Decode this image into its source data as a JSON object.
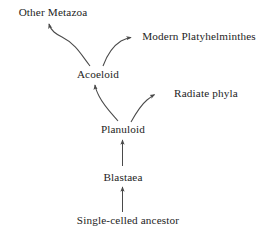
{
  "diagram": {
    "background_color": "#ffffff",
    "stroke_color": "#4a4a4a",
    "text_color": "#242424",
    "nodes": [
      {
        "id": "other_metazoa",
        "label": "Other Metazoa",
        "x": 53,
        "y": 13
      },
      {
        "id": "modern_platyhelminthes",
        "label": "Modern Platyhelminthes",
        "x": 199,
        "y": 37
      },
      {
        "id": "acoeloid",
        "label": "Acoeloid",
        "x": 98,
        "y": 75
      },
      {
        "id": "radiate_phyla",
        "label": "Radiate phyla",
        "x": 206,
        "y": 94
      },
      {
        "id": "planuloid",
        "label": "Planuloid",
        "x": 123,
        "y": 130
      },
      {
        "id": "blastaea",
        "label": "Blastaea",
        "x": 123,
        "y": 178
      },
      {
        "id": "single_celled_ancestor",
        "label": "Single-celled ancestor",
        "x": 128,
        "y": 221
      }
    ],
    "edges": [
      {
        "id": "acoeloid-to-other-metazoa",
        "from": "acoeloid",
        "to": "other_metazoa",
        "style": "curved"
      },
      {
        "id": "acoeloid-to-modern-platyhelminthes",
        "from": "acoeloid",
        "to": "modern_platyhelminthes",
        "style": "curved"
      },
      {
        "id": "planuloid-to-acoeloid",
        "from": "planuloid",
        "to": "acoeloid",
        "style": "curved"
      },
      {
        "id": "planuloid-to-radiate-phyla",
        "from": "planuloid",
        "to": "radiate_phyla",
        "style": "curved"
      },
      {
        "id": "blastaea-to-planuloid",
        "from": "blastaea",
        "to": "planuloid",
        "style": "straight"
      },
      {
        "id": "single-celled-ancestor-to-blastaea",
        "from": "single_celled_ancestor",
        "to": "blastaea",
        "style": "straight"
      }
    ]
  }
}
